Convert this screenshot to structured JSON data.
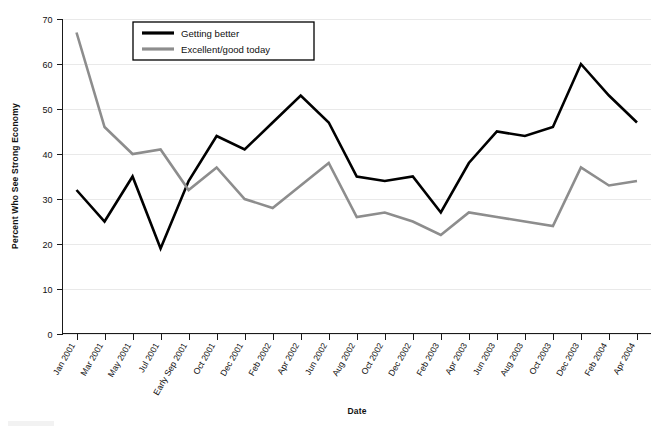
{
  "chart_data": {
    "type": "line",
    "title": "",
    "xlabel": "Date",
    "ylabel": "Percent Who See Strong Economy",
    "ylim": [
      0,
      70
    ],
    "yticks": [
      0,
      10,
      20,
      30,
      40,
      50,
      60,
      70
    ],
    "grid": true,
    "legend_position": "top-center-left",
    "categories": [
      "Jan 2001",
      "Mar 2001",
      "May 2001",
      "Jul 2001",
      "Early Sep 2001",
      "Oct 2001",
      "Dec 2001",
      "Feb 2002",
      "Apr 2002",
      "Jun 2002",
      "Aug 2002",
      "Oct 2002",
      "Dec 2002",
      "Feb 2003",
      "Apr 2003",
      "Jun 2003",
      "Aug 2003",
      "Oct 2003",
      "Dec 2003",
      "Feb 2004",
      "Apr 2004"
    ],
    "series": [
      {
        "name": "Getting better",
        "color": "#000000",
        "width": 2.6,
        "values": [
          32,
          25,
          35,
          19,
          34,
          44,
          41,
          47,
          53,
          47,
          35,
          34,
          35,
          27,
          38,
          45,
          44,
          46,
          60,
          53,
          47
        ]
      },
      {
        "name": "Excellent/good today",
        "color": "#8d8d8d",
        "width": 2.6,
        "values": [
          67,
          46,
          40,
          41,
          32,
          37,
          30,
          28,
          33,
          38,
          26,
          27,
          25,
          22,
          27,
          26,
          25,
          24,
          37,
          33,
          34
        ]
      }
    ]
  },
  "legend": {
    "entries": [
      {
        "label": "Getting better",
        "color": "#000000"
      },
      {
        "label": "Excellent/good today",
        "color": "#8d8d8d"
      }
    ]
  },
  "axes": {
    "y_title": "Percent Who See Strong Economy",
    "x_title": "Date",
    "y_tick_labels": [
      "0",
      "10",
      "20",
      "30",
      "40",
      "50",
      "60",
      "70"
    ]
  },
  "colors": {
    "series_primary": "#000000",
    "series_secondary": "#8d8d8d",
    "grid": "#e9e9e9",
    "axis": "#1a1a1a",
    "background": "#ffffff"
  }
}
